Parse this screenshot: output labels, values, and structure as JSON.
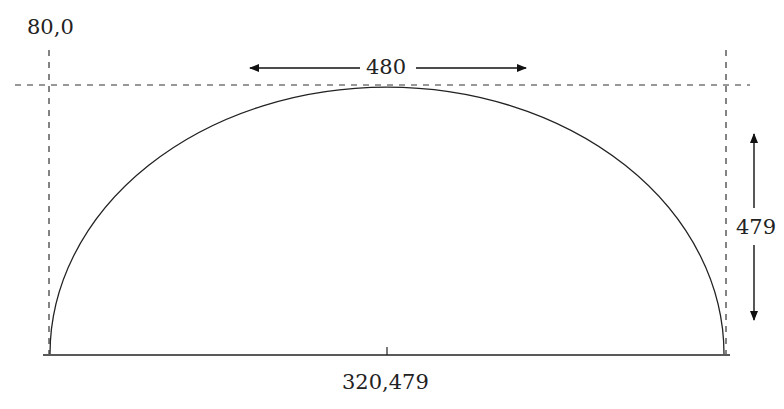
{
  "diagram": {
    "type": "semi-ellipse arc geometry",
    "labels": {
      "origin": "80,0",
      "width": "480",
      "height": "479",
      "center": "320,479"
    },
    "shape": {
      "kind": "half-ellipse",
      "center_x": 320,
      "center_y": 479,
      "width": 480,
      "height": 479
    },
    "colors": {
      "stroke": "#222222",
      "background": "#ffffff"
    }
  }
}
